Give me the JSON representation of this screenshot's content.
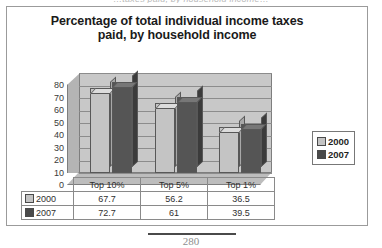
{
  "page": {
    "clipped_header_text": "…taxes paid, by household income…",
    "page_number": "280"
  },
  "chart_data": {
    "type": "bar",
    "title": "Percentage of total individual income taxes paid, by household income",
    "title_line1": "Percentage of total individual income taxes",
    "title_line2": "paid, by household income",
    "xlabel": "",
    "ylabel": "",
    "ylim": [
      0,
      80
    ],
    "yticks": [
      80,
      70,
      60,
      50,
      40,
      30,
      20,
      10,
      0
    ],
    "grid": true,
    "legend_position": "right",
    "categories": [
      "Top 10%",
      "Top 5%",
      "Top 1%"
    ],
    "series": [
      {
        "name": "2000",
        "color": "#c4c4c4",
        "values": [
          67.7,
          56.2,
          36.5
        ],
        "labels": [
          "67.7",
          "56.2",
          "36.5"
        ]
      },
      {
        "name": "2007",
        "color": "#555555",
        "values": [
          72.7,
          61,
          39.5
        ],
        "labels": [
          "72.7",
          "61",
          "39.5"
        ]
      }
    ]
  },
  "legend": {
    "items": [
      {
        "label": "2000",
        "swatch": "light-gray-swatch-icon"
      },
      {
        "label": "2007",
        "swatch": "dark-gray-swatch-icon"
      }
    ]
  },
  "table": {
    "column_headers": [
      "",
      "Top 10%",
      "Top 5%",
      "Top 1%"
    ],
    "rows": [
      {
        "label": "2000",
        "cells": [
          "67.7",
          "56.2",
          "36.5"
        ]
      },
      {
        "label": "2007",
        "cells": [
          "72.7",
          "61",
          "39.5"
        ]
      }
    ]
  }
}
